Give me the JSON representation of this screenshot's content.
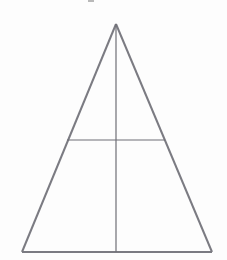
{
  "figure": {
    "title": "Isosceles triangle with median and midsegment",
    "background_color": "#fdfdfd",
    "canvas": {
      "width": 227,
      "height": 260
    },
    "stroke_colors": {
      "outline": "#7b7b82",
      "interior": "#6f6f76",
      "speck": "#b9b9b9"
    },
    "stroke_widths": {
      "outline": 2.0,
      "interior": 1.2
    },
    "vertices": {
      "apex": {
        "name": "apex",
        "x": 116,
        "y": 24
      },
      "bottom_left": {
        "name": "bottom-left",
        "x": 22,
        "y": 252
      },
      "bottom_right": {
        "name": "bottom-right",
        "x": 212,
        "y": 252
      }
    },
    "segments": [
      {
        "name": "left-edge",
        "label": "Left slanted side",
        "x1": 116,
        "y1": 24,
        "x2": 22,
        "y2": 252,
        "color": "#7b7b82",
        "width": 2.0
      },
      {
        "name": "right-edge",
        "label": "Right slanted side",
        "x1": 116,
        "y1": 24,
        "x2": 212,
        "y2": 252,
        "color": "#7b7b82",
        "width": 2.0
      },
      {
        "name": "base-edge",
        "label": "Base",
        "x1": 22,
        "y1": 252,
        "x2": 212,
        "y2": 252,
        "color": "#7b7b82",
        "width": 2.0
      },
      {
        "name": "median-vertical",
        "label": "Vertical median from apex to base",
        "x1": 116,
        "y1": 24,
        "x2": 116,
        "y2": 252,
        "color": "#6f6f76",
        "width": 1.2
      },
      {
        "name": "midsegment-horizontal",
        "label": "Horizontal segment parallel to base",
        "x1": 67,
        "y1": 140,
        "x2": 165,
        "y2": 140,
        "color": "#6f6f76",
        "width": 1.2
      }
    ],
    "artifacts": [
      {
        "name": "top-edge-speck",
        "label": "Faint scan artifact near top edge",
        "x": 88,
        "y": 0,
        "width": 6,
        "height": 2,
        "color": "#b9b9b9"
      }
    ]
  }
}
